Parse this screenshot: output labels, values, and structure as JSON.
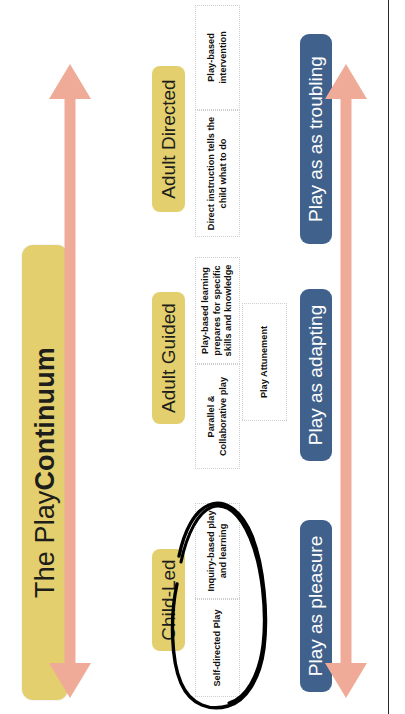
{
  "poster": {
    "title_light": "The Play ",
    "title_bold": "Continuum",
    "background_color": "#ffffff",
    "accent_yellow": "#e3cf6d",
    "accent_blue": "#40618c",
    "accent_salmon": "#efab97",
    "annotation_color": "#000000"
  },
  "stages": [
    {
      "id": "child-led",
      "label": "Child-Led"
    },
    {
      "id": "adult-guided",
      "label": "Adult Guided"
    },
    {
      "id": "adult-directed",
      "label": "Adult Directed"
    }
  ],
  "descriptors": [
    {
      "id": "self-directed-play",
      "text": "Self-directed Play"
    },
    {
      "id": "inquiry-based-play",
      "text": "Inquiry-based play and learning"
    },
    {
      "id": "parallel-collaborative-play",
      "text": "Parallel & Collaborative play"
    },
    {
      "id": "play-based-learning",
      "text": "Play-based learning prepares for specific skills and knowledge"
    },
    {
      "id": "direct-instruction",
      "text": "Direct instruction tells the child what to do"
    },
    {
      "id": "play-based-intervention",
      "text": "Play-based intervention"
    }
  ],
  "attunement": {
    "text": "Play Attunement"
  },
  "play_modes": [
    {
      "id": "play-as-pleasure",
      "label": "Play as pleasure"
    },
    {
      "id": "play-as-adapting",
      "label": "Play as adapting"
    },
    {
      "id": "play-as-troubling",
      "label": "Play as as troubling"
    }
  ],
  "arrows": [
    {
      "id": "continuum-arrow",
      "type": "double-headed-horizontal"
    },
    {
      "id": "play-modes-arrow",
      "type": "double-headed-horizontal"
    }
  ],
  "footnote": {
    "text": ""
  }
}
